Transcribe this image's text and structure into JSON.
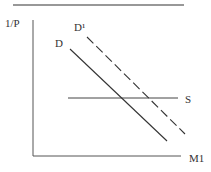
{
  "diagram": {
    "type": "supply-demand",
    "y_axis_label": "1/P",
    "x_axis_label": "M1",
    "curves": [
      {
        "name": "D",
        "label": "D",
        "style": "solid"
      },
      {
        "name": "D1",
        "label": "D¹",
        "style": "dashed"
      },
      {
        "name": "S",
        "label": "S",
        "style": "solid-horizontal"
      }
    ],
    "colors": {
      "line": "#333333",
      "background": "#ffffff"
    }
  }
}
